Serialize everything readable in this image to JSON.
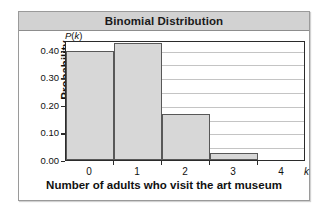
{
  "figure": {
    "title": "Binomial Distribution",
    "background_color": "#ffffff",
    "frame_color": "#9a9a9a",
    "title_band_color": "#d2d2d2"
  },
  "chart_data": {
    "type": "bar",
    "title": "Binomial Distribution",
    "xlabel": "Number of adults who visit the art museum",
    "ylabel": "Probability",
    "x_axis_symbol": "k",
    "y_axis_symbol": "P(k)",
    "categories": [
      "0",
      "1",
      "2",
      "3",
      "4"
    ],
    "values": [
      0.395,
      0.425,
      0.165,
      0.027,
      0.0
    ],
    "xlim": [
      -0.5,
      4.5
    ],
    "ylim": [
      0.0,
      0.435
    ],
    "ytick_labels": [
      "0.00",
      "0.10",
      "0.20",
      "0.30",
      "0.40"
    ],
    "ytick_values": [
      0.0,
      0.1,
      0.2,
      0.3,
      0.4
    ],
    "gridline_values": [
      0.05,
      0.1,
      0.15,
      0.2,
      0.25,
      0.3,
      0.35,
      0.4
    ],
    "grid": true,
    "grid_axis": "y",
    "legend": false,
    "bar_fill_color": "#d7d7d7",
    "bar_edge_color": "#585858",
    "gridline_color": "#c4c4c4",
    "axis_color": "#2b2b2b"
  }
}
